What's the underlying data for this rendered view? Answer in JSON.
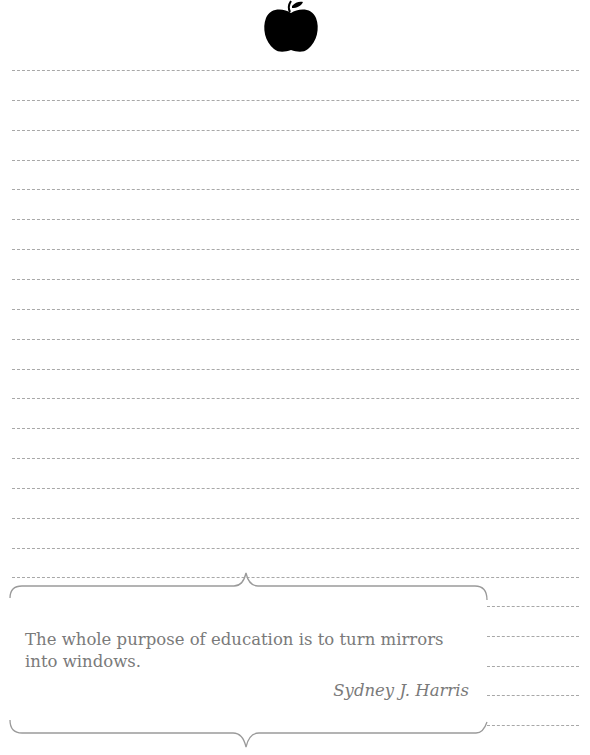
{
  "header": {
    "icon": "apple-icon",
    "icon_color": "#000000"
  },
  "lines": {
    "full_width": {
      "count": 18,
      "x_start": 12,
      "x_end": 579,
      "y_start": 70,
      "spacing": 29.85
    },
    "short": {
      "count": 5,
      "x_start": 487,
      "x_end": 579,
      "y_positions": [
        606,
        636,
        666,
        695,
        725
      ]
    },
    "color": "#a8a8a8"
  },
  "quote": {
    "text": "The whole purpose of education is to turn mirrors into windows.",
    "author": "Sydney J. Harris",
    "text_color": "#7a7a7a"
  }
}
